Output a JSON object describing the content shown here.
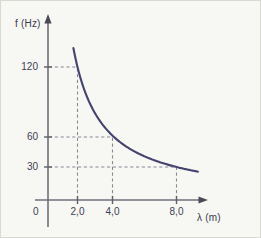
{
  "figure": {
    "background_color": "#f7f7f4",
    "border_color": "#d9d9d4",
    "curve_color": "#44446e",
    "axis_color": "#6f6f78",
    "grid_color": "#8f8f97",
    "text_color": "#3f3f52"
  },
  "chart_data": {
    "type": "line",
    "title": "",
    "subtitle": "",
    "xlabel": "λ (m)",
    "ylabel": "f (Hz)",
    "relation": "f = 240 / λ",
    "constant": 240,
    "origin_label": "0",
    "grid": true,
    "grid_style": "dashed",
    "legend": false,
    "legend_position": "none",
    "xlim": [
      0,
      10.6
    ],
    "ylim": [
      0,
      168
    ],
    "x_ticks": [
      {
        "value": 2.0,
        "label": "2,0"
      },
      {
        "value": 4.0,
        "label": "4,0"
      },
      {
        "value": 8.0,
        "label": "8,0"
      }
    ],
    "y_ticks": [
      {
        "value": 120,
        "label": "120"
      },
      {
        "value": 60,
        "label": "60"
      },
      {
        "value": 30,
        "label": "30"
      }
    ],
    "x": [
      1.75,
      2.0,
      2.4,
      2.8,
      3.2,
      3.6,
      4.0,
      4.6,
      5.2,
      5.8,
      6.4,
      7.0,
      7.6,
      8.0,
      8.6,
      9.3
    ],
    "values": [
      137,
      120,
      100,
      86,
      75,
      67,
      60,
      52,
      46,
      41,
      37.5,
      34,
      32,
      30,
      28,
      26
    ],
    "annotated_points": [
      {
        "x": 2.0,
        "y": 120
      },
      {
        "x": 4.0,
        "y": 60
      },
      {
        "x": 8.0,
        "y": 30
      }
    ],
    "series": [
      {
        "name": "f vs λ",
        "color": "#44446e",
        "x": [
          1.75,
          2.0,
          2.4,
          2.8,
          3.2,
          3.6,
          4.0,
          4.6,
          5.2,
          5.8,
          6.4,
          7.0,
          7.6,
          8.0,
          8.6,
          9.3
        ],
        "values": [
          137,
          120,
          100,
          86,
          75,
          67,
          60,
          52,
          46,
          41,
          37.5,
          34,
          32,
          30,
          28,
          26
        ]
      }
    ]
  }
}
